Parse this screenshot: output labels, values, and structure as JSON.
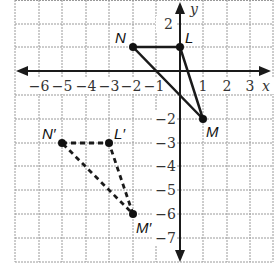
{
  "diagram": {
    "type": "coordinate-plane-transformation",
    "axes": {
      "x_label": "x",
      "y_label": "y",
      "x_ticks": [
        "−6",
        "−5",
        "−4",
        "−3",
        "−2",
        "−1",
        "1",
        "2",
        "3"
      ],
      "y_ticks": [
        "2",
        "−2",
        "−3",
        "−4",
        "−5",
        "−6",
        "−7"
      ]
    },
    "original_triangle": {
      "style": "solid",
      "vertices": [
        {
          "label": "N",
          "x": -2,
          "y": 1
        },
        {
          "label": "L",
          "x": 0,
          "y": 1
        },
        {
          "label": "M",
          "x": 1,
          "y": -2
        }
      ]
    },
    "image_triangle": {
      "style": "dashed",
      "vertices": [
        {
          "label": "N′",
          "x": -5,
          "y": -3
        },
        {
          "label": "L′",
          "x": -3,
          "y": -3
        },
        {
          "label": "M′",
          "x": -2,
          "y": -6
        }
      ]
    },
    "colors": {
      "grid": "#9a9a9a",
      "ink": "#1a1a1a"
    }
  }
}
